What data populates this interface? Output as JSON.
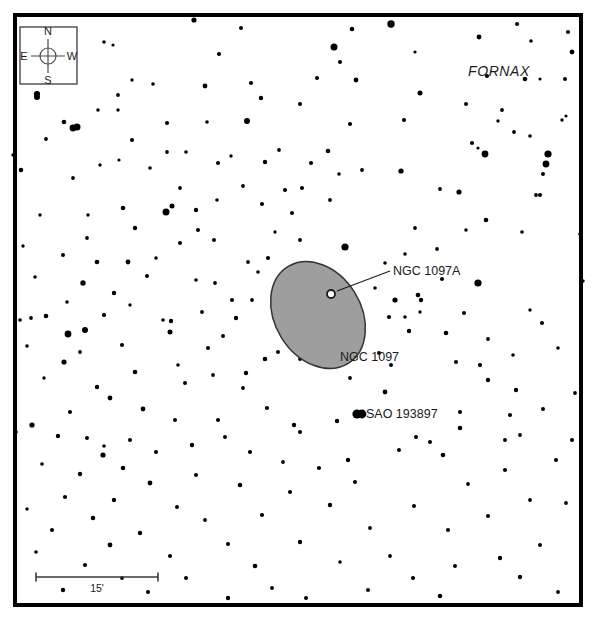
{
  "chart_data": {
    "type": "scatter",
    "title": "",
    "xlabel": "",
    "ylabel": "",
    "frame": {
      "x": 13,
      "y": 13,
      "width": 570,
      "height": 594,
      "border_color": "#000000",
      "border_width": 4
    },
    "background_color": "#ffffff",
    "star_color": "#000000",
    "galaxy_fill": "#9e9e9e",
    "galaxy_stroke": "#333333",
    "stars": [
      [
        194,
        20,
        2.6
      ],
      [
        241,
        28,
        2.0
      ],
      [
        352,
        29,
        2.3
      ],
      [
        391,
        24,
        3.7
      ],
      [
        517,
        24,
        2.0
      ],
      [
        479,
        37,
        2.4
      ],
      [
        531,
        41,
        1.8
      ],
      [
        568,
        32,
        2.1
      ],
      [
        572,
        52,
        2.4
      ],
      [
        104,
        42,
        1.8
      ],
      [
        113,
        45,
        1.6
      ],
      [
        75,
        56,
        2.0
      ],
      [
        334,
        47,
        3.5
      ],
      [
        219,
        54,
        2.1
      ],
      [
        415,
        52,
        1.6
      ],
      [
        340,
        62,
        2.0
      ],
      [
        37,
        94,
        3.1
      ],
      [
        132,
        80,
        1.7
      ],
      [
        487,
        76,
        2.1
      ],
      [
        525,
        79,
        2.3
      ],
      [
        153,
        84,
        1.8
      ],
      [
        251,
        83,
        2.1
      ],
      [
        317,
        78,
        2.0
      ],
      [
        356,
        80,
        2.4
      ],
      [
        118,
        95,
        1.9
      ],
      [
        205,
        86,
        2.4
      ],
      [
        420,
        93,
        2.5
      ],
      [
        540,
        79,
        1.6
      ],
      [
        565,
        79,
        2.0
      ],
      [
        37,
        97,
        3.0
      ],
      [
        73,
        128,
        3.4
      ],
      [
        118,
        110,
        1.7
      ],
      [
        466,
        104,
        2.0
      ],
      [
        566,
        116,
        1.6
      ],
      [
        98,
        110,
        1.8
      ],
      [
        261,
        98,
        2.2
      ],
      [
        300,
        104,
        2.0
      ],
      [
        514,
        132,
        1.9
      ],
      [
        64,
        122,
        2.3
      ],
      [
        167,
        123,
        2.1
      ],
      [
        207,
        122,
        1.8
      ],
      [
        548,
        154,
        3.6
      ],
      [
        77,
        127,
        3.5
      ],
      [
        247,
        121,
        3.0
      ],
      [
        350,
        124,
        2.1
      ],
      [
        502,
        110,
        1.9
      ],
      [
        186,
        152,
        1.8
      ],
      [
        231,
        156,
        1.7
      ],
      [
        279,
        150,
        1.9
      ],
      [
        311,
        163,
        2.1
      ],
      [
        46,
        139,
        1.9
      ],
      [
        132,
        140,
        2.0
      ],
      [
        167,
        152,
        1.9
      ],
      [
        485,
        154,
        3.4
      ],
      [
        218,
        163,
        2.0
      ],
      [
        265,
        162,
        2.2
      ],
      [
        328,
        151,
        2.3
      ],
      [
        530,
        136,
        1.8
      ],
      [
        13,
        155,
        1.7
      ],
      [
        100,
        165,
        1.7
      ],
      [
        150,
        168,
        1.8
      ],
      [
        401,
        171,
        2.6
      ],
      [
        21,
        170,
        2.3
      ],
      [
        73,
        178,
        1.9
      ],
      [
        196,
        210,
        2.2
      ],
      [
        440,
        189,
        1.9
      ],
      [
        180,
        188,
        1.9
      ],
      [
        243,
        186,
        1.9
      ],
      [
        285,
        190,
        2.1
      ],
      [
        459,
        192,
        2.6
      ],
      [
        123,
        208,
        2.3
      ],
      [
        172,
        206,
        2.5
      ],
      [
        262,
        204,
        2.0
      ],
      [
        540,
        195,
        2.0
      ],
      [
        166,
        212,
        3.5
      ],
      [
        217,
        200,
        1.8
      ],
      [
        292,
        213,
        2.0
      ],
      [
        486,
        220,
        2.3
      ],
      [
        135,
        228,
        2.2
      ],
      [
        198,
        230,
        2.0
      ],
      [
        275,
        232,
        1.7
      ],
      [
        415,
        228,
        1.9
      ],
      [
        87,
        238,
        1.9
      ],
      [
        180,
        243,
        2.0
      ],
      [
        300,
        240,
        1.9
      ],
      [
        466,
        230,
        1.8
      ],
      [
        40,
        215,
        1.7
      ],
      [
        214,
        240,
        2.0
      ],
      [
        345,
        247,
        3.6
      ],
      [
        522,
        232,
        1.8
      ],
      [
        63,
        255,
        2.0
      ],
      [
        128,
        262,
        2.4
      ],
      [
        248,
        262,
        1.9
      ],
      [
        405,
        254,
        1.8
      ],
      [
        97,
        262,
        2.3
      ],
      [
        156,
        258,
        1.8
      ],
      [
        268,
        258,
        2.1
      ],
      [
        437,
        249,
        1.9
      ],
      [
        35,
        277,
        1.8
      ],
      [
        147,
        276,
        2.0
      ],
      [
        196,
        280,
        1.8
      ],
      [
        442,
        279,
        2.0
      ],
      [
        83,
        283,
        2.7
      ],
      [
        114,
        293,
        2.2
      ],
      [
        215,
        283,
        1.9
      ],
      [
        478,
        283,
        3.6
      ],
      [
        67,
        302,
        1.8
      ],
      [
        130,
        305,
        1.7
      ],
      [
        232,
        300,
        2.0
      ],
      [
        421,
        300,
        2.2
      ],
      [
        46,
        316,
        2.3
      ],
      [
        104,
        315,
        2.1
      ],
      [
        202,
        312,
        1.9
      ],
      [
        464,
        313,
        2.0
      ],
      [
        163,
        320,
        1.8
      ],
      [
        236,
        318,
        2.2
      ],
      [
        405,
        317,
        1.8
      ],
      [
        530,
        310,
        1.7
      ],
      [
        85,
        330,
        3.0
      ],
      [
        170,
        332,
        2.5
      ],
      [
        223,
        336,
        2.0
      ],
      [
        446,
        333,
        2.3
      ],
      [
        27,
        346,
        1.8
      ],
      [
        122,
        345,
        2.1
      ],
      [
        208,
        348,
        2.0
      ],
      [
        488,
        339,
        1.9
      ],
      [
        64,
        362,
        2.6
      ],
      [
        178,
        365,
        1.8
      ],
      [
        379,
        353,
        2.0
      ],
      [
        513,
        355,
        1.8
      ],
      [
        135,
        372,
        2.3
      ],
      [
        246,
        373,
        2.2
      ],
      [
        391,
        365,
        2.0
      ],
      [
        558,
        348,
        1.8
      ],
      [
        31,
        318,
        1.9
      ],
      [
        68,
        334,
        3.4
      ],
      [
        305,
        339,
        1.9
      ],
      [
        362,
        330,
        1.9
      ],
      [
        171,
        321,
        2.2
      ],
      [
        213,
        375,
        1.9
      ],
      [
        409,
        331,
        2.2
      ],
      [
        542,
        323,
        2.0
      ],
      [
        20,
        320,
        1.8
      ],
      [
        80,
        352,
        1.9
      ],
      [
        265,
        359,
        2.3
      ],
      [
        456,
        362,
        2.1
      ],
      [
        44,
        378,
        1.7
      ],
      [
        97,
        387,
        2.2
      ],
      [
        185,
        383,
        2.0
      ],
      [
        488,
        380,
        2.2
      ],
      [
        110,
        398,
        2.4
      ],
      [
        243,
        388,
        1.9
      ],
      [
        362,
        414,
        4.4
      ],
      [
        516,
        390,
        2.2
      ],
      [
        70,
        412,
        2.0
      ],
      [
        143,
        409,
        2.4
      ],
      [
        267,
        408,
        2.1
      ],
      [
        543,
        409,
        2.0
      ],
      [
        32,
        425,
        2.6
      ],
      [
        175,
        420,
        2.0
      ],
      [
        294,
        425,
        2.2
      ],
      [
        460,
        428,
        2.3
      ],
      [
        58,
        436,
        2.2
      ],
      [
        130,
        440,
        2.1
      ],
      [
        225,
        437,
        2.0
      ],
      [
        520,
        435,
        1.9
      ],
      [
        103,
        455,
        2.6
      ],
      [
        156,
        452,
        2.0
      ],
      [
        250,
        452,
        2.1
      ],
      [
        399,
        450,
        2.0
      ],
      [
        42,
        464,
        1.8
      ],
      [
        123,
        468,
        2.3
      ],
      [
        283,
        462,
        1.9
      ],
      [
        443,
        455,
        2.3
      ],
      [
        80,
        474,
        2.2
      ],
      [
        196,
        475,
        2.0
      ],
      [
        319,
        468,
        2.1
      ],
      [
        505,
        470,
        2.1
      ],
      [
        150,
        483,
        2.4
      ],
      [
        240,
        485,
        2.3
      ],
      [
        355,
        482,
        2.0
      ],
      [
        468,
        484,
        1.9
      ],
      [
        65,
        497,
        2.1
      ],
      [
        114,
        500,
        2.2
      ],
      [
        290,
        492,
        2.0
      ],
      [
        530,
        500,
        1.9
      ],
      [
        27,
        509,
        1.7
      ],
      [
        177,
        507,
        2.0
      ],
      [
        330,
        505,
        2.2
      ],
      [
        414,
        506,
        2.0
      ],
      [
        93,
        518,
        2.3
      ],
      [
        205,
        520,
        1.9
      ],
      [
        262,
        515,
        2.1
      ],
      [
        488,
        516,
        2.0
      ],
      [
        52,
        530,
        2.0
      ],
      [
        140,
        533,
        2.2
      ],
      [
        370,
        528,
        1.9
      ],
      [
        448,
        530,
        2.1
      ],
      [
        110,
        545,
        2.4
      ],
      [
        228,
        544,
        2.0
      ],
      [
        300,
        542,
        2.2
      ],
      [
        540,
        545,
        2.0
      ],
      [
        36,
        552,
        1.8
      ],
      [
        170,
        556,
        2.0
      ],
      [
        390,
        556,
        1.9
      ],
      [
        500,
        558,
        2.2
      ],
      [
        85,
        565,
        2.1
      ],
      [
        255,
        566,
        2.3
      ],
      [
        340,
        562,
        1.8
      ],
      [
        455,
        566,
        2.0
      ],
      [
        122,
        578,
        1.9
      ],
      [
        186,
        578,
        2.0
      ],
      [
        413,
        578,
        2.1
      ],
      [
        520,
        577,
        2.2
      ],
      [
        63,
        590,
        2.2
      ],
      [
        148,
        592,
        2.0
      ],
      [
        272,
        588,
        1.9
      ],
      [
        368,
        590,
        2.0
      ],
      [
        228,
        598,
        2.2
      ],
      [
        306,
        598,
        2.0
      ],
      [
        440,
        596,
        2.3
      ],
      [
        558,
        592,
        1.9
      ],
      [
        404,
        120,
        2.1
      ],
      [
        498,
        121,
        1.7
      ],
      [
        472,
        143,
        2.1
      ],
      [
        478,
        148,
        1.6
      ],
      [
        546,
        164,
        3.4
      ],
      [
        543,
        174,
        2.0
      ],
      [
        536,
        195,
        1.9
      ],
      [
        562,
        120,
        1.7
      ],
      [
        339,
        174,
        1.8
      ],
      [
        362,
        170,
        1.9
      ],
      [
        302,
        188,
        2.0
      ],
      [
        330,
        200,
        1.9
      ],
      [
        252,
        300,
        1.9
      ],
      [
        258,
        272,
        1.8
      ],
      [
        395,
        300,
        2.6
      ],
      [
        418,
        295,
        2.3
      ],
      [
        389,
        317,
        2.1
      ],
      [
        420,
        312,
        1.7
      ],
      [
        375,
        288,
        1.8
      ],
      [
        385,
        263,
        1.8
      ],
      [
        300,
        432,
        2.0
      ],
      [
        337,
        421,
        2.2
      ],
      [
        350,
        378,
        1.9
      ],
      [
        480,
        365,
        2.1
      ],
      [
        385,
        392,
        2.4
      ],
      [
        300,
        359,
        1.9
      ],
      [
        278,
        352,
        2.0
      ],
      [
        330,
        357,
        1.9
      ],
      [
        416,
        437,
        2.0
      ],
      [
        430,
        442,
        2.0
      ],
      [
        510,
        415,
        2.1
      ],
      [
        566,
        503,
        1.9
      ],
      [
        218,
        420,
        2.0
      ],
      [
        192,
        445,
        2.2
      ],
      [
        87,
        438,
        2.0
      ],
      [
        104,
        446,
        1.8
      ],
      [
        348,
        460,
        2.2
      ],
      [
        460,
        412,
        2.0
      ],
      [
        505,
        440,
        2.0
      ],
      [
        556,
        460,
        2.0
      ],
      [
        23,
        246,
        1.7
      ],
      [
        16,
        432,
        1.8
      ],
      [
        580,
        234,
        1.8
      ],
      [
        583,
        281,
        1.7
      ],
      [
        575,
        393,
        1.9
      ],
      [
        572,
        440,
        2.0
      ],
      [
        119,
        160,
        1.6
      ],
      [
        88,
        215,
        1.7
      ]
    ],
    "galaxy": {
      "name": "NGC 1097",
      "cx": 318,
      "cy": 315,
      "rx": 43,
      "ry": 57,
      "rotation_deg": -32,
      "label_x": 340,
      "label_y": 361
    },
    "companion": {
      "name": "NGC 1097A",
      "cx": 331,
      "cy": 294,
      "r": 4,
      "leader_x1": 337,
      "leader_y1": 291,
      "leader_x2": 390,
      "leader_y2": 271,
      "label_x": 393,
      "label_y": 275
    },
    "named_star": {
      "name": "SAO 193897",
      "cx": 357,
      "cy": 414,
      "r": 4.6,
      "label_x": 366,
      "label_y": 418
    },
    "constellation": {
      "name": "FORNAX",
      "x": 499,
      "y": 76
    },
    "compass": {
      "box": {
        "x": 20,
        "y": 27,
        "width": 57,
        "height": 57
      },
      "north": "N",
      "south": "S",
      "east": "E",
      "west": "W",
      "cx": 48,
      "cy": 56,
      "r": 8
    },
    "scale_bar": {
      "label": "15'",
      "x1": 36,
      "x2": 158,
      "y": 577,
      "tick_height": 9,
      "label_x": 97,
      "label_y": 592
    }
  }
}
